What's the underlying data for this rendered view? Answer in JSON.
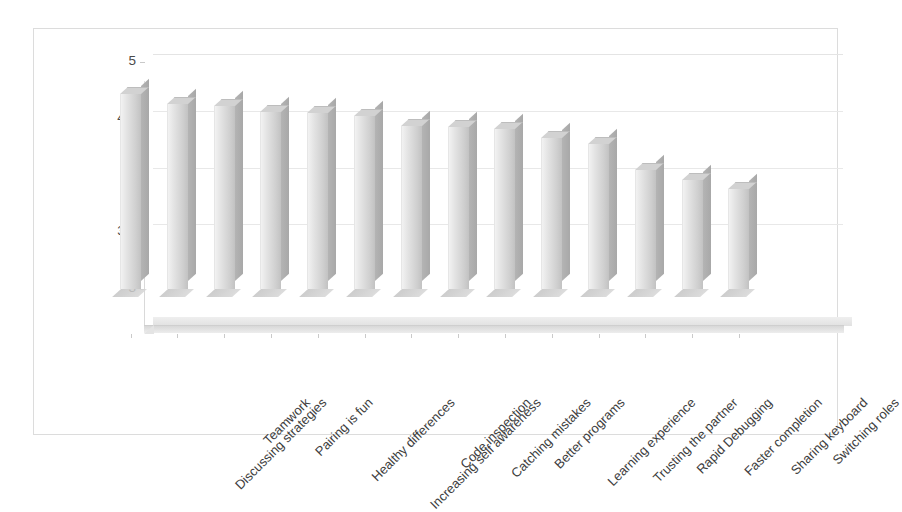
{
  "chart_data": {
    "type": "bar",
    "title": "",
    "subtitle": "",
    "xlabel": "",
    "ylabel": "",
    "ylim": [
      3,
      5
    ],
    "yticks": [
      "3",
      "3.5",
      "4",
      "4.5",
      "5"
    ],
    "ytick_values": [
      3,
      3.5,
      4,
      4.5,
      5
    ],
    "grid": true,
    "legend": false,
    "style": "3d-column",
    "categories": [
      "Discussing strategies",
      "Teamwork",
      "Pairing is fun",
      "Healthy differences",
      "Increasing self awareness",
      "Code inspection",
      "Catching mistakes",
      "Better programs",
      "Learning experience",
      "Trusting the partner",
      "Rapid Debugging",
      "Faster completion",
      "Sharing keyboard",
      "Switching roles"
    ],
    "values": [
      4.72,
      4.63,
      4.61,
      4.56,
      4.55,
      4.52,
      4.44,
      4.43,
      4.41,
      4.33,
      4.28,
      4.05,
      3.96,
      3.88
    ],
    "colors": {
      "bar_front": "#dcdcdc",
      "bar_side": "#aeaeae",
      "bar_top": "#d2d2d2",
      "gridline": "#e8e8e8",
      "axis_text": "#4a4a4a",
      "frame_border": "#dcdcdc",
      "background": "#ffffff"
    }
  }
}
